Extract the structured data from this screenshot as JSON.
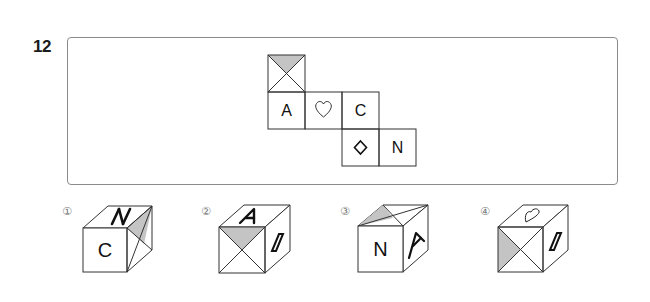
{
  "question": {
    "number": "12",
    "net": {
      "cells": [
        {
          "row": 0,
          "col": 0,
          "content": "diagonal-x-shaded-top"
        },
        {
          "row": 1,
          "col": 0,
          "content": "A"
        },
        {
          "row": 1,
          "col": 1,
          "content": "heart-outline"
        },
        {
          "row": 1,
          "col": 2,
          "content": "C"
        },
        {
          "row": 2,
          "col": 2,
          "content": "diamond-outline"
        },
        {
          "row": 2,
          "col": 3,
          "content": "N"
        }
      ],
      "labels": {
        "a": "A",
        "c": "C",
        "n": "N"
      }
    },
    "options": [
      {
        "number": "①",
        "front": "C",
        "top": "N",
        "right": "diagonal-shaded-face"
      },
      {
        "number": "②",
        "front": "diagonal-x-shaded-top",
        "top": "A",
        "right": "parallelogram"
      },
      {
        "number": "③",
        "front": "N",
        "top": "diagonal-shaded-face",
        "right": "A"
      },
      {
        "number": "④",
        "front": "diagonal-x-shaded-left",
        "top": "heart-outline",
        "right": "parallelogram"
      }
    ]
  },
  "colors": {
    "line": "#333333",
    "shade": "#c4c4c4",
    "frame": "#8a8a8a"
  }
}
